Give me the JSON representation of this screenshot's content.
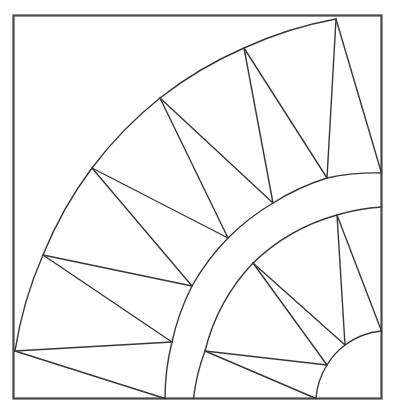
{
  "figure": {
    "name": "new-york-beauty-quilt-block-line-drawing",
    "canvas": {
      "width": 396,
      "height": 411
    },
    "colors": {
      "background": "#ffffff",
      "border": "#474747",
      "line": "#383838"
    },
    "stroke": {
      "border_width": 2.2,
      "line_width": 1.4
    },
    "border": {
      "x": 13.5,
      "y": 15.5,
      "width": 368,
      "height": 383
    },
    "center": [
      388.5,
      403
    ],
    "arcs": [
      {
        "name": "outer-arc",
        "radius": 385,
        "points": [
          [
            336,
            19
          ],
          [
            244,
            48
          ],
          [
            160,
            98
          ],
          [
            92,
            168
          ],
          [
            43,
            255
          ],
          [
            15,
            351
          ]
        ]
      },
      {
        "name": "ring-outer-arc",
        "radius": 231,
        "points": [
          [
            381.5,
            173
          ],
          [
            327,
            178
          ],
          [
            273,
            203
          ],
          [
            228,
            238
          ],
          [
            192,
            286
          ],
          [
            172,
            342
          ],
          [
            165,
            398.5
          ]
        ]
      },
      {
        "name": "ring-inner-arc",
        "radius": 196,
        "points": [
          [
            381.5,
            207
          ],
          [
            337,
            215
          ],
          [
            253,
            263
          ],
          [
            205,
            351
          ],
          [
            193.5,
            398.5
          ]
        ]
      },
      {
        "name": "inner-quarter-circle-arc",
        "radius": 72.5,
        "points": [
          [
            381.5,
            331
          ],
          [
            345,
            345
          ],
          [
            327,
            365
          ],
          [
            316,
            398.5
          ]
        ]
      }
    ],
    "outer_spikes": [
      {
        "apex": [
          336,
          19
        ],
        "base": [
          [
            381.5,
            173
          ],
          [
            327,
            178
          ]
        ]
      },
      {
        "apex": [
          244,
          48
        ],
        "base": [
          [
            327,
            178
          ],
          [
            273,
            203
          ]
        ]
      },
      {
        "apex": [
          160,
          98
        ],
        "base": [
          [
            273,
            203
          ],
          [
            228,
            238
          ]
        ]
      },
      {
        "apex": [
          92,
          168
        ],
        "base": [
          [
            228,
            238
          ],
          [
            192,
            286
          ]
        ]
      },
      {
        "apex": [
          43,
          255
        ],
        "base": [
          [
            192,
            286
          ],
          [
            172,
            342
          ]
        ]
      },
      {
        "apex": [
          15,
          351
        ],
        "base": [
          [
            172,
            342
          ],
          [
            165,
            398.5
          ]
        ]
      }
    ],
    "inner_spikes": [
      {
        "apex": [
          337,
          215
        ],
        "base": [
          [
            381.5,
            331
          ],
          [
            345,
            345
          ]
        ]
      },
      {
        "apex": [
          253,
          263
        ],
        "base": [
          [
            345,
            345
          ],
          [
            327,
            365
          ]
        ]
      },
      {
        "apex": [
          205,
          351
        ],
        "base": [
          [
            327,
            365
          ],
          [
            316,
            398.5
          ]
        ]
      }
    ]
  }
}
